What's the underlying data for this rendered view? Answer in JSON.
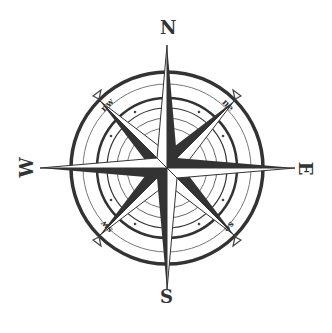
{
  "compass": {
    "cardinals": {
      "north": "N",
      "east": "E",
      "south": "S",
      "west": "W"
    },
    "intercardinals": {
      "northwest": "nw",
      "northeast": "ne",
      "southeast": "se",
      "southwest": "sw"
    },
    "colors": {
      "ink": "#333333",
      "light": "#9a9a9a",
      "background": "#ffffff"
    }
  }
}
